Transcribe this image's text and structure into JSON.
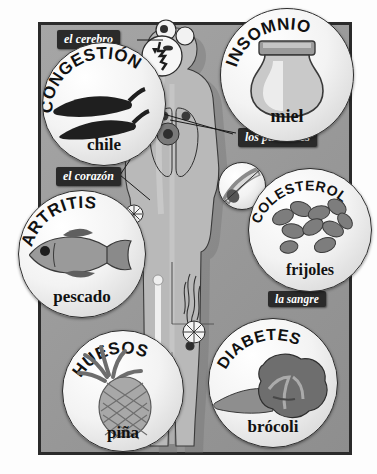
{
  "poster": {
    "panel_bg": "#9d9d9d",
    "border_color": "#2b2b2b",
    "plaque_bg": "#2a2a2a"
  },
  "body_labels": [
    {
      "id": "brain",
      "text": "el cerebro",
      "color": "#ffffff"
    },
    {
      "id": "lungs",
      "text": "los pulmones",
      "color": "#ffffff"
    },
    {
      "id": "heart",
      "text": "el corazón",
      "color": "#ffffff"
    },
    {
      "id": "blood",
      "text": "la sangre",
      "color": "#ffffff"
    }
  ],
  "callouts": [
    {
      "id": "congestion",
      "condition": "CONGESTIÓN",
      "food": "chile",
      "icon": "chile-pepper-icon"
    },
    {
      "id": "insomnio",
      "condition": "INSOMNIO",
      "food": "miel",
      "icon": "honey-jar-icon"
    },
    {
      "id": "colesterol",
      "condition": "COLESTEROL",
      "food": "frijoles",
      "icon": "beans-icon"
    },
    {
      "id": "artritis",
      "condition": "ARTRITIS",
      "food": "pescado",
      "icon": "fish-icon"
    },
    {
      "id": "huesos",
      "condition": "HUESOS",
      "food": "piña",
      "icon": "pineapple-icon"
    },
    {
      "id": "diabetes",
      "condition": "DIABETES",
      "food": "brócoli",
      "icon": "broccoli-icon"
    }
  ]
}
